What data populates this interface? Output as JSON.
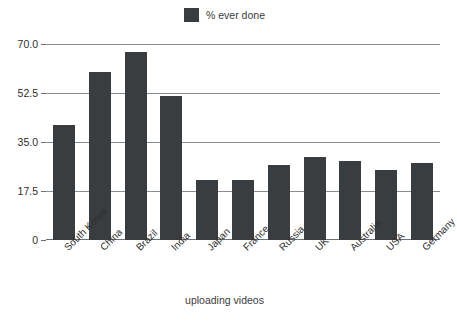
{
  "chart_data": {
    "type": "bar",
    "title": "",
    "xlabel": "uploading videos",
    "ylabel": "",
    "categories": [
      "South Korea",
      "China",
      "Brazil",
      "India",
      "Japan",
      "France",
      "Russia",
      "UK",
      "Australia",
      "USA",
      "Germany"
    ],
    "series": [
      {
        "name": "% ever done",
        "values": [
          41.0,
          60.0,
          67.0,
          51.5,
          21.5,
          21.5,
          26.8,
          29.6,
          28.2,
          25.0,
          27.5
        ]
      }
    ],
    "values": [
      41.0,
      60.0,
      67.0,
      51.5,
      21.5,
      21.5,
      26.8,
      29.6,
      28.2,
      25.0,
      27.5
    ],
    "ylim": [
      0,
      70
    ],
    "yticks": [
      0,
      17.5,
      35.0,
      52.5,
      70.0
    ],
    "ytick_labels": [
      "0",
      "17.5",
      "35.0",
      "52.5",
      "70.0"
    ],
    "grid": true,
    "legend_position": "top-center",
    "bar_color": "#3a3d40",
    "gridline_color": "#8a8d90"
  },
  "legend": {
    "items": [
      {
        "label": "% ever done",
        "color": "#3a3d40"
      }
    ]
  },
  "axes": {
    "x_title": "uploading videos"
  }
}
